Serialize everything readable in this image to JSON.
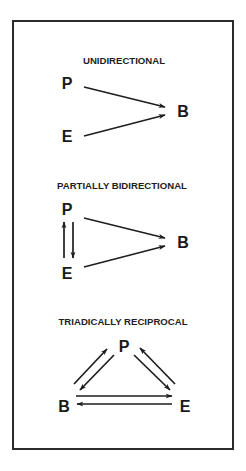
{
  "figure": {
    "frame": {
      "x": 13,
      "y": 21,
      "width": 220,
      "height": 428,
      "color": "#2b2b2b"
    },
    "text_color": "#1e1e1e",
    "panels": [
      {
        "id": "unidirectional",
        "title": "UNIDIRECTIONAL",
        "title_pos": {
          "x": 124,
          "y": 64
        },
        "nodes": [
          {
            "label": "P",
            "x": 67,
            "y": 89
          },
          {
            "label": "E",
            "x": 67,
            "y": 142
          },
          {
            "label": "B",
            "x": 183,
            "y": 117
          }
        ],
        "arrows": [
          {
            "from": "P",
            "to": "B",
            "x1": 84,
            "y1": 87,
            "x2": 165,
            "y2": 107
          },
          {
            "from": "E",
            "to": "B",
            "x1": 84,
            "y1": 136,
            "x2": 165,
            "y2": 115
          }
        ]
      },
      {
        "id": "partially-bidirectional",
        "title": "PARTIALLY BIDIRECTIONAL",
        "title_pos": {
          "x": 122,
          "y": 189
        },
        "nodes": [
          {
            "label": "P",
            "x": 67,
            "y": 215
          },
          {
            "label": "E",
            "x": 67,
            "y": 279
          },
          {
            "label": "B",
            "x": 183,
            "y": 248
          }
        ],
        "arrows": [
          {
            "from": "E",
            "to": "P",
            "x1": 64,
            "y1": 258,
            "x2": 64,
            "y2": 222
          },
          {
            "from": "P",
            "to": "E",
            "x1": 73,
            "y1": 222,
            "x2": 73,
            "y2": 258
          },
          {
            "from": "P",
            "to": "B",
            "x1": 84,
            "y1": 218,
            "x2": 165,
            "y2": 238
          },
          {
            "from": "E",
            "to": "B",
            "x1": 84,
            "y1": 267,
            "x2": 165,
            "y2": 246
          }
        ]
      },
      {
        "id": "triadically-reciprocal",
        "title": "TRIADICALLY RECIPROCAL",
        "title_pos": {
          "x": 123,
          "y": 325
        },
        "nodes": [
          {
            "label": "P",
            "x": 124,
            "y": 352
          },
          {
            "label": "B",
            "x": 64,
            "y": 412
          },
          {
            "label": "E",
            "x": 185,
            "y": 412
          }
        ],
        "arrows": [
          {
            "from": "B",
            "to": "P",
            "x1": 74,
            "y1": 384,
            "x2": 107,
            "y2": 349
          },
          {
            "from": "P",
            "to": "B",
            "x1": 114,
            "y1": 355,
            "x2": 80,
            "y2": 390
          },
          {
            "from": "P",
            "to": "E",
            "x1": 134,
            "y1": 355,
            "x2": 170,
            "y2": 390
          },
          {
            "from": "E",
            "to": "P",
            "x1": 175,
            "y1": 384,
            "x2": 140,
            "y2": 348
          },
          {
            "from": "B",
            "to": "E",
            "x1": 76,
            "y1": 396,
            "x2": 172,
            "y2": 396
          },
          {
            "from": "E",
            "to": "B",
            "x1": 172,
            "y1": 404,
            "x2": 77,
            "y2": 404
          }
        ]
      }
    ]
  }
}
